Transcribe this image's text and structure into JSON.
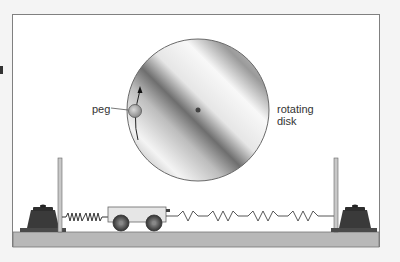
{
  "figure": {
    "labels": {
      "peg": "peg",
      "disk_line1": "rotating",
      "disk_line2": "disk"
    },
    "colors": {
      "background": "#f4f4f4",
      "frame_fill": "#ffffff",
      "frame_border": "#808080",
      "ground": "#b8b8b8",
      "weight": "#3a3a3a",
      "disk_edge": "#707070",
      "cart_body": "#e8e8e8"
    },
    "components": [
      "rotating disk",
      "peg",
      "rotation arrow",
      "cart with two wheels",
      "short spring (left)",
      "long spring (right)",
      "left post",
      "right post",
      "left weight",
      "right weight",
      "ground"
    ]
  }
}
